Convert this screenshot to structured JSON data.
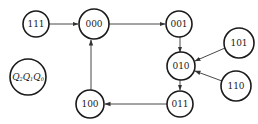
{
  "diagram": {
    "type": "state-transition",
    "legend": {
      "label": "Q₂Q₁Q₀",
      "parts": [
        {
          "var": "Q",
          "sub": "2"
        },
        {
          "var": "Q",
          "sub": "1"
        },
        {
          "var": "Q",
          "sub": "0"
        }
      ]
    },
    "nodes": [
      {
        "id": "111",
        "label": "111"
      },
      {
        "id": "000",
        "label": "000"
      },
      {
        "id": "001",
        "label": "001"
      },
      {
        "id": "101",
        "label": "101"
      },
      {
        "id": "010",
        "label": "010"
      },
      {
        "id": "110",
        "label": "110"
      },
      {
        "id": "011",
        "label": "011"
      },
      {
        "id": "100",
        "label": "100"
      }
    ],
    "edges": [
      {
        "from": "111",
        "to": "000"
      },
      {
        "from": "000",
        "to": "001"
      },
      {
        "from": "001",
        "to": "010"
      },
      {
        "from": "101",
        "to": "010"
      },
      {
        "from": "110",
        "to": "010"
      },
      {
        "from": "010",
        "to": "011"
      },
      {
        "from": "011",
        "to": "100"
      },
      {
        "from": "100",
        "to": "000"
      }
    ],
    "colors": {
      "stroke": "#1a1a1a",
      "edge": "#333333",
      "background": "#ffffff"
    }
  }
}
